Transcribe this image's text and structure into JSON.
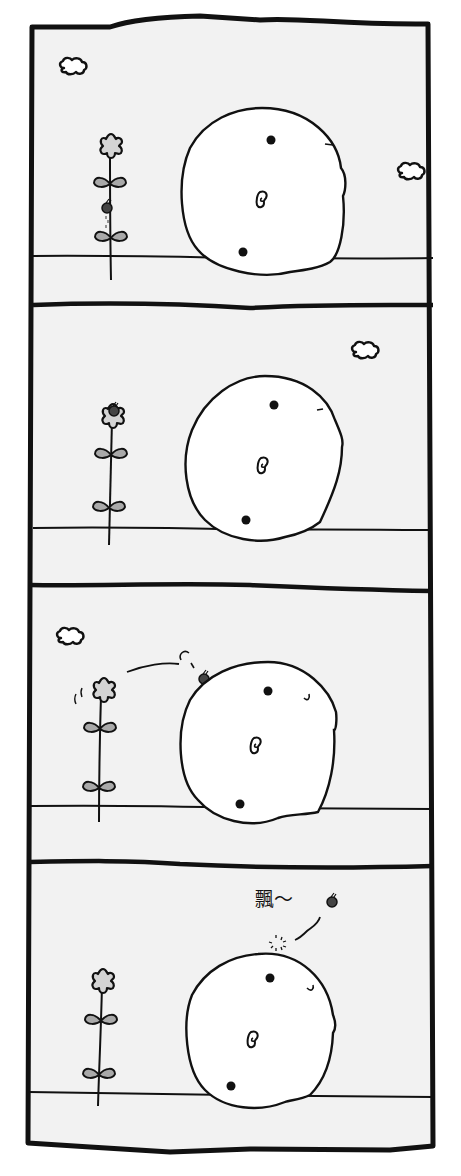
{
  "comic": {
    "layout": "4-panel vertical strip",
    "colors": {
      "page_bg": "#ffffff",
      "panel_bg": "#f2f2f2",
      "ink": "#111111",
      "body_fill": "#ffffff",
      "petal_fill": "#d4d4d4",
      "leaf_fill": "#a9a9a9",
      "bug_fill": "#444444"
    },
    "panels": [
      {
        "index": 1,
        "description": "Round white creature resting on the ground; a ladybug climbs the flower stem; clouds in the sky",
        "elements": [
          "cloud",
          "cloud",
          "flower",
          "ladybug-on-stem",
          "round-creature",
          "ground-line"
        ]
      },
      {
        "index": 2,
        "description": "Ladybug has reached the top of the flower",
        "elements": [
          "cloud",
          "flower-with-ladybug",
          "round-creature",
          "ground-line"
        ]
      },
      {
        "index": 3,
        "description": "Ladybug hops from the flower onto the creature's head; flower sways",
        "elements": [
          "cloud",
          "swaying-flower",
          "jump-arc",
          "ladybug-on-head",
          "round-creature",
          "ground-line"
        ]
      },
      {
        "index": 4,
        "description": "Ladybug floats away from the creature's head",
        "sound_effect": "飄～",
        "elements": [
          "flower",
          "sparkle",
          "float-trail",
          "ladybug-floating",
          "round-creature",
          "ground-line"
        ]
      }
    ]
  }
}
